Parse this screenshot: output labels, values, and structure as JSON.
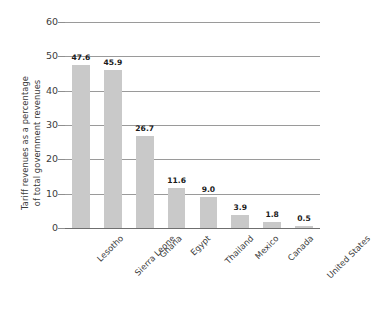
{
  "chart_data": {
    "type": "bar",
    "title": "",
    "xlabel": "",
    "ylabel": "Tariff revenues as a percentage of total government revenues",
    "ylabel_lines": [
      "Tariff revenues as a percentage",
      "of total government revenues"
    ],
    "categories": [
      "Lesotho",
      "Sierra Leone",
      "Ghana",
      "Egypt",
      "Thailand",
      "Mexico",
      "Canada",
      "United States"
    ],
    "values": [
      47.6,
      45.9,
      26.7,
      11.6,
      9.0,
      3.9,
      1.8,
      0.5
    ],
    "value_labels": [
      "47.6",
      "45.9",
      "26.7",
      "11.6",
      "9.0",
      "3.9",
      "1.8",
      "0.5"
    ],
    "ylim": [
      0,
      60
    ],
    "yticks": [
      0,
      10,
      20,
      30,
      40,
      50,
      60
    ],
    "ytick_labels": [
      "0",
      "10",
      "20",
      "30",
      "40",
      "50",
      "60"
    ],
    "grid": true,
    "grid_axis": "y",
    "legend": false,
    "legend_position": "none",
    "bar_color": "#c9c9c9",
    "grid_color": "#9a9a9a",
    "axis_color": "#6f6f6f",
    "text_color": "#3a3a3a",
    "value_label_color": "#1a1a1a",
    "background_color": "#ffffff",
    "xtick_rotation": 45
  }
}
